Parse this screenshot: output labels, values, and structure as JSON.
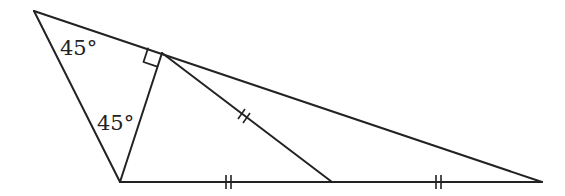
{
  "diagram": {
    "type": "geometry-triangle",
    "points": {
      "A": [
        34,
        11
      ],
      "B": [
        120,
        182
      ],
      "C": [
        542,
        182
      ],
      "D": [
        162,
        53
      ],
      "M": [
        332,
        182
      ]
    },
    "segments": [
      {
        "name": "side-AB",
        "from": "A",
        "to": "B"
      },
      {
        "name": "side-AC",
        "from": "A",
        "to": "C"
      },
      {
        "name": "side-BC",
        "from": "B",
        "to": "C"
      },
      {
        "name": "altitude-BD",
        "from": "B",
        "to": "D"
      },
      {
        "name": "median-DM",
        "from": "D",
        "to": "M"
      }
    ],
    "labels": {
      "angle_top": "45°",
      "angle_bottom": "45°"
    },
    "marks": {
      "right_angle_at": "D",
      "equal_length_ticks": [
        "DM",
        "BM",
        "MC"
      ],
      "tick_style": "double"
    },
    "colors": {
      "stroke": "#222222",
      "background": "#ffffff"
    }
  }
}
